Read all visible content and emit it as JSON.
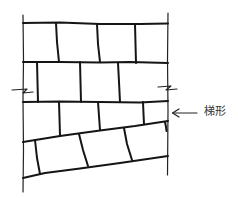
{
  "diagram": {
    "annotation": {
      "label": "梯形",
      "arrow": "left-arrow",
      "points_to": "trapezoidal course (sloped row)"
    },
    "colors": {
      "stroke": "#151515",
      "background": "#ffffff",
      "label": "#333333"
    },
    "courses": [
      {
        "name": "course-1",
        "shape": "rectangular",
        "blocks": 4
      },
      {
        "name": "course-2",
        "shape": "rectangular",
        "blocks": 4
      },
      {
        "name": "course-3",
        "shape": "trapezoidal",
        "blocks": 4
      },
      {
        "name": "course-4",
        "shape": "sloped",
        "blocks": 4
      }
    ]
  }
}
